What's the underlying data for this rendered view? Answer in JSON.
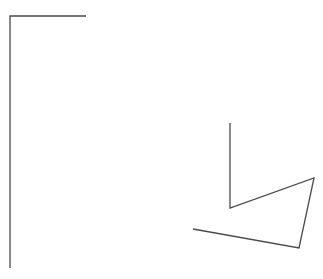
{
  "canvas": {
    "width": 323,
    "height": 279,
    "background": "#ffffff"
  },
  "stroke": {
    "color": "#4a4a4a",
    "width": 1.3
  },
  "shapes": {
    "left_bracket": {
      "points": "86,16 10,16 10,268"
    },
    "right_polyline": {
      "points": "230,123 230,208 314,178 299,248 193,229"
    }
  }
}
